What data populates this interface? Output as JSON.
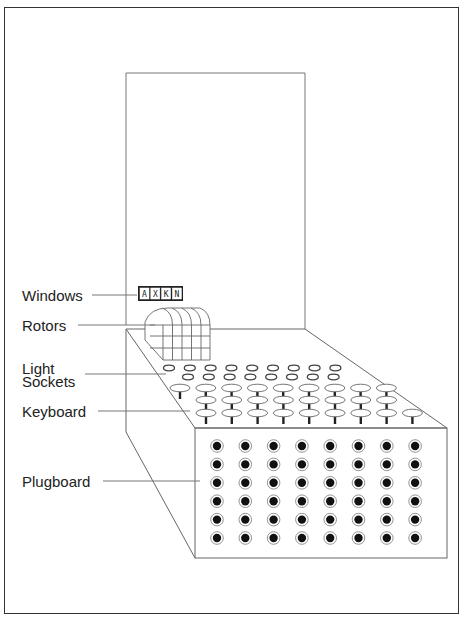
{
  "diagram": {
    "labels": {
      "windows": "Windows",
      "rotors": "Rotors",
      "light_sockets_line1": "Light",
      "light_sockets_line2": "Sockets",
      "keyboard": "Keyboard",
      "plugboard": "Plugboard"
    },
    "window_letters": [
      "A",
      "X",
      "K",
      "N"
    ],
    "rotor_count": 4,
    "light_socket_rows": [
      9,
      8
    ],
    "keyboard_rows": [
      9,
      8,
      9
    ],
    "plugboard_grid": {
      "columns": 8,
      "rows": 6
    },
    "colors": {
      "line": "#555555",
      "frame": "#333333",
      "plug_hole": "#111111",
      "background": "#ffffff"
    }
  }
}
